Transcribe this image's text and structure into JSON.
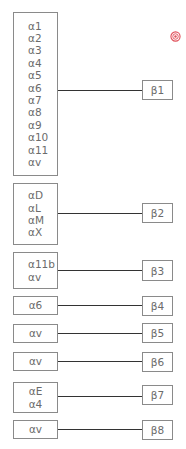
{
  "diagram": {
    "groups": [
      {
        "alpha": [
          "α1",
          "α2",
          "α3",
          "α4",
          "α5",
          "α6",
          "α7",
          "α8",
          "α9",
          "α10",
          "α11",
          "αv"
        ],
        "beta": "β1"
      },
      {
        "alpha": [
          "αD",
          "αL",
          "αM",
          "αX"
        ],
        "beta": "β2"
      },
      {
        "alpha": [
          "α11b",
          "αv"
        ],
        "beta": "β3"
      },
      {
        "alpha": [
          "α6"
        ],
        "beta": "β4"
      },
      {
        "alpha": [
          "αv"
        ],
        "beta": "β5"
      },
      {
        "alpha": [
          "αv"
        ],
        "beta": "β6"
      },
      {
        "alpha": [
          "αE",
          "α4"
        ],
        "beta": "β7"
      },
      {
        "alpha": [
          "αv"
        ],
        "beta": "β8"
      }
    ],
    "marker_icon": "target-icon",
    "colors": {
      "box_border": "#8a8a8a",
      "connector": "#333333",
      "text": "#6b6b6b",
      "marker": "#e0505a"
    }
  }
}
